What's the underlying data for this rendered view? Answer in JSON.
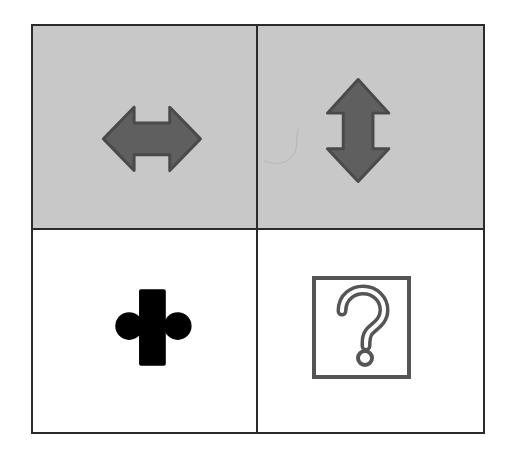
{
  "puzzle": {
    "layout": "2x2 grid",
    "colors": {
      "grid_line": "#2b2b2b",
      "shaded_cell": "#c8c8c8",
      "plain_cell": "#ffffff",
      "arrow_fill": "#5f5f5f",
      "arrow_stroke": "#4a4a4a",
      "black_shape": "#000000",
      "question_box": "#555555"
    },
    "cells": [
      {
        "row": 0,
        "col": 0,
        "background": "#c8c8c8",
        "icon": "horizontal-double-arrow-icon"
      },
      {
        "row": 0,
        "col": 1,
        "background": "#c8c8c8",
        "icon": "vertical-double-arrow-icon"
      },
      {
        "row": 1,
        "col": 0,
        "background": "#ffffff",
        "icon": "bar-with-circles-icon"
      },
      {
        "row": 1,
        "col": 1,
        "background": "#ffffff",
        "icon": "question-mark-box-icon"
      }
    ]
  }
}
